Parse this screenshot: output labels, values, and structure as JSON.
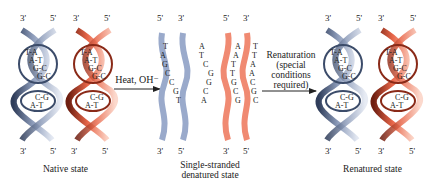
{
  "colors": {
    "blue_strand": "#9aaacb",
    "blue_dark": "#3c4c6a",
    "red_strand": "#f08a72",
    "red_dark": "#8a2a18",
    "text": "#222222"
  },
  "native": {
    "label": "Native state",
    "top_ends": [
      "3'",
      "5'",
      "3'",
      "5'"
    ],
    "bottom_ends": [
      "3'",
      "5'",
      "3'",
      "5'"
    ],
    "blue_pairs_top": [
      "T-A",
      "A-T",
      "G-C",
      "G-C"
    ],
    "blue_pairs_bottom": [
      "C-G",
      "A-T"
    ],
    "red_pairs_top": [
      "T-A",
      "A-T",
      "G-C",
      "G-C"
    ],
    "red_pairs_bottom": [
      "C-G",
      "A-T"
    ]
  },
  "arrow1": {
    "label": "Heat, OH⁻"
  },
  "denatured": {
    "label_line1": "Single-stranded",
    "label_line2": "denatured state",
    "top_ends": [
      "5'",
      "3'",
      "5'",
      "3'"
    ],
    "bottom_ends": [
      "3'",
      "5'",
      "3'",
      "5'"
    ],
    "strand1_bases": [
      "T",
      "A",
      "G",
      "C",
      "C",
      "G",
      "T"
    ],
    "strand2_bases": [
      "A",
      "T",
      "C",
      "G",
      "G",
      "C",
      "A"
    ],
    "strand3_bases": [
      "A",
      "A",
      "T",
      "T",
      "G",
      "C",
      "G"
    ],
    "strand4_bases": [
      "T",
      "T",
      "A",
      "A",
      "C",
      "G",
      "C"
    ]
  },
  "arrow2": {
    "label_line1": "Renaturation",
    "label_line2": "(special",
    "label_line3": "conditions",
    "label_line4": "required)"
  },
  "renatured": {
    "label": "Renatured state",
    "top_ends": [
      "3'",
      "5'",
      "3'",
      "5'"
    ],
    "bottom_ends": [
      "3'",
      "5'",
      "3'",
      "5'"
    ],
    "blue_pairs_top": [
      "T-A",
      "A-T",
      "G-C",
      "G-C"
    ],
    "blue_pairs_bottom": [
      "C-G",
      "A-T"
    ],
    "red_pairs_top": [
      "T-A",
      "A-T",
      "G-C",
      "G-C"
    ],
    "red_pairs_bottom": [
      "C-G",
      "A-T"
    ]
  }
}
